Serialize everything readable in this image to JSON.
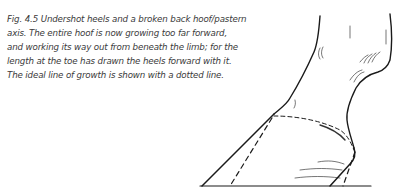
{
  "figure": {
    "caption_lines": [
      "Fig. 4.5 Undershot heels and a broken back hoof/pastern",
      "axis. The entire hoof is now growing too far forward,",
      "and working its way out from beneath the limb; for the",
      "length at the toe has drawn the heels forward with it.",
      "The ideal line of growth is shown with a dotted line."
    ],
    "illustration": "Line drawing of a horse's lower limb and hoof with undershot heels and broken back hoof/pastern axis; dashed lines show ideal line of growth",
    "colors": {
      "ink": "#1a1a1a",
      "text": "#3a3a3a"
    }
  }
}
